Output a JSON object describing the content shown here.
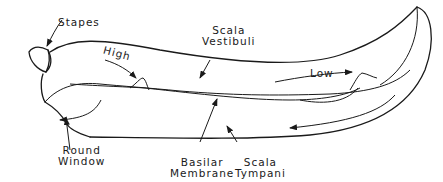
{
  "diagram": {
    "labels": {
      "stapes": "Stapes",
      "scala_vestibuli_1": "Scala",
      "scala_vestibuli_2": "Vestibuli",
      "high": "High",
      "low": "Low",
      "round_window_1": "Round",
      "round_window_2": "Window",
      "basilar_membrane_1": "Basilar",
      "basilar_membrane_2": "Membrane",
      "scala_tympani_1": "Scala",
      "scala_tympani_2": "Tympani"
    },
    "colors": {
      "line": "#1a1a1a",
      "background": "#ffffff"
    }
  }
}
